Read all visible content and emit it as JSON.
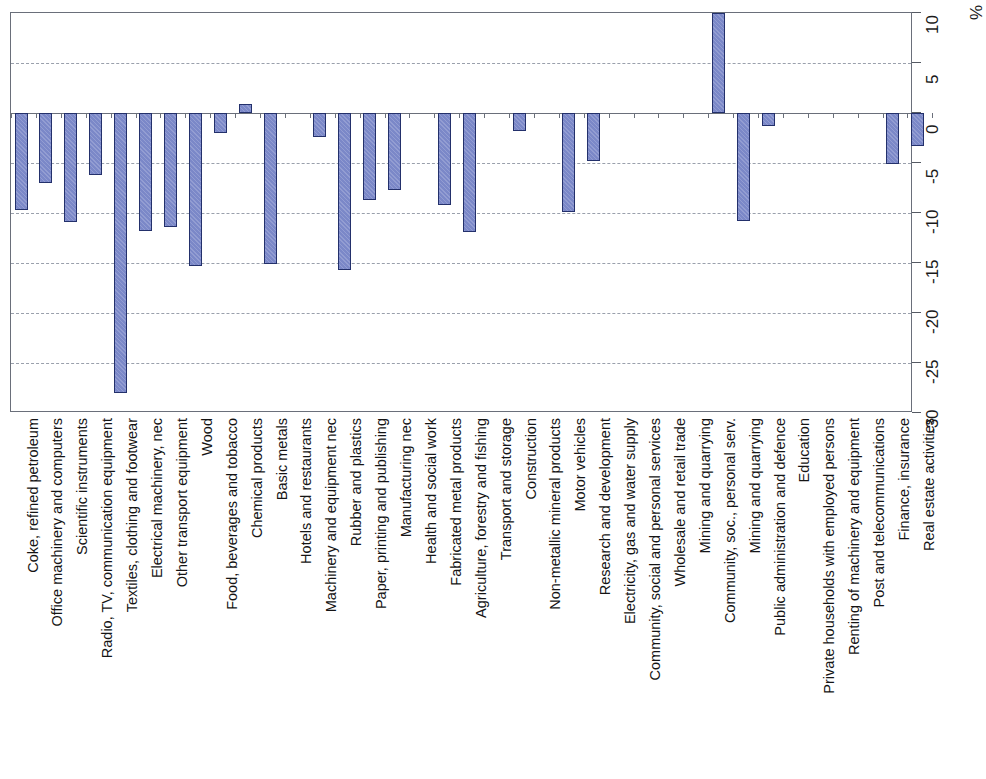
{
  "chart_data": {
    "type": "bar",
    "title": "",
    "subtitle": "",
    "xlabel": "",
    "ylabel": "",
    "unit_label": "%",
    "ylim": [
      -30,
      10
    ],
    "ytick_labels": [
      "10",
      "5",
      "0",
      "-5",
      "-10",
      "-15",
      "-20",
      "-25",
      "-30"
    ],
    "ytick_values": [
      10,
      5,
      0,
      -5,
      -10,
      -15,
      -20,
      -25,
      -30
    ],
    "grid": true,
    "grid_axis": "y",
    "legend": "none",
    "orientation": "vertical",
    "bar_fill_color": "#7b88c8",
    "bar_border_color": "#23306b",
    "axis_color": "#6a6f7a",
    "gridline_color": "#9aa0ac",
    "categories": [
      "Coke, refined petroleum",
      "Office machinery and computers",
      "Scientific instruments",
      "Radio, TV, communication equipment",
      "Textiles, clothing and footwear",
      "Electrical machinery, nec",
      "Other transport equipment",
      "Wood",
      "Food, beverages and tobacco",
      "Chemical products",
      "Basic metals",
      "Hotels and restaurants",
      "Machinery and equipment nec",
      "Rubber and plastics",
      "Paper, printing and publishing",
      "Manufacturing nec",
      "Health and social work",
      "Fabricated metal products",
      "Agriculture, forestry and fishing",
      "Transport and storage",
      "Construction",
      "Non-metallic mineral products",
      "Motor vehicles",
      "Research and development",
      "Electricity, gas and water supply",
      "Community, social and personal services",
      "Wholesale and retail trade",
      "Mining and quarrying",
      "Community, soc., personal serv.",
      "Mining and quarrying",
      "Public administration and defence",
      "Education",
      "Private households with employed persons",
      "Renting of machinery and equipment",
      "Post and telecommunications",
      "Finance, insurance",
      "Real estate activities"
    ],
    "values": [
      -9.7,
      -7.0,
      -10.9,
      -6.2,
      -28.0,
      -11.8,
      -11.4,
      -15.3,
      -2.0,
      0.9,
      -15.1,
      0,
      -2.4,
      -15.7,
      -8.7,
      -7.7,
      0,
      -9.2,
      -11.9,
      0,
      -1.8,
      0,
      -9.9,
      -4.8,
      0,
      0,
      0,
      0,
      10.0,
      -10.8,
      -1.3,
      0,
      0,
      0,
      0,
      -5.1,
      -3.3
    ]
  }
}
